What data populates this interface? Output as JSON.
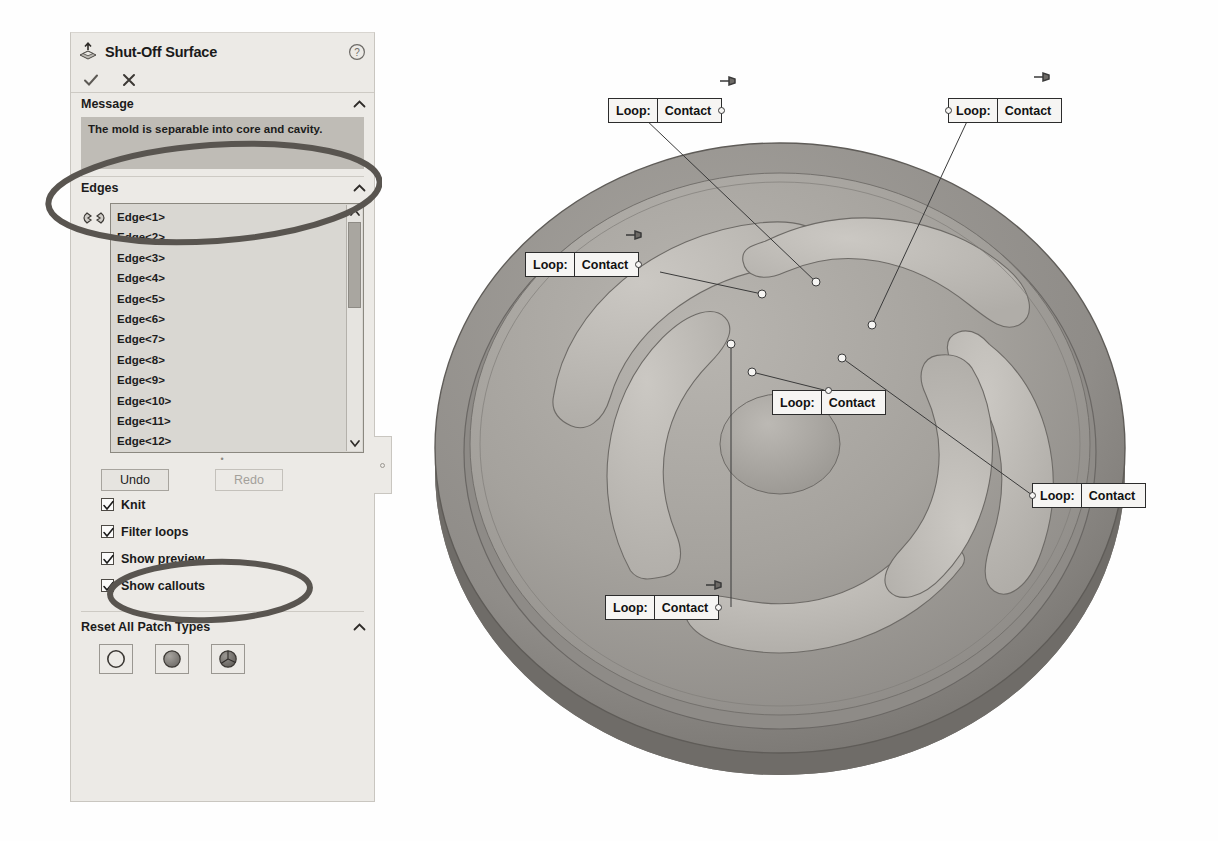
{
  "panel": {
    "title": "Shut-Off Surface",
    "title_icon": "shut-off-surface-icon",
    "help_icon": "help-icon",
    "ok_icon": "checkmark-icon",
    "cancel_icon": "x-icon",
    "sections": {
      "message": {
        "header": "Message",
        "collapse_icon": "chevron-up-icon",
        "text": "The mold is separable into core and cavity."
      },
      "edges": {
        "header": "Edges",
        "collapse_icon": "chevron-up-icon",
        "selection_icon": "edge-selection-icon",
        "items": [
          "Edge<1>",
          "Edge<2>",
          "Edge<3>",
          "Edge<4>",
          "Edge<5>",
          "Edge<6>",
          "Edge<7>",
          "Edge<8>",
          "Edge<9>",
          "Edge<10>",
          "Edge<11>",
          "Edge<12>"
        ],
        "scroll_up_icon": "chevron-up-icon",
        "scroll_down_icon": "chevron-down-icon"
      },
      "patch_types": {
        "header": "Reset All Patch Types",
        "collapse_icon": "chevron-up-icon",
        "buttons": [
          {
            "name": "no-fill-patch",
            "icon": "circle-outline-icon"
          },
          {
            "name": "contact-patch",
            "icon": "shaded-sphere-icon"
          },
          {
            "name": "tangent-patch",
            "icon": "sphere-with-seams-icon"
          }
        ]
      }
    },
    "buttons": {
      "undo": {
        "label": "Undo",
        "disabled": false
      },
      "redo": {
        "label": "Redo",
        "disabled": true
      }
    },
    "checkboxes": [
      {
        "label": "Knit",
        "checked": true
      },
      {
        "label": "Filter loops",
        "checked": true
      },
      {
        "label": "Show preview",
        "checked": true
      },
      {
        "label": "Show callouts",
        "checked": true
      }
    ]
  },
  "graphics": {
    "model_name": "impeller-shaded-model",
    "callouts": [
      {
        "key": "Loop:",
        "value": "Contact",
        "anchor": "right",
        "pin": true
      },
      {
        "key": "Loop:",
        "value": "Contact",
        "anchor": "left",
        "pin": true
      },
      {
        "key": "Loop:",
        "value": "Contact",
        "anchor": "right",
        "pin": true
      },
      {
        "key": "Loop:",
        "value": "Contact",
        "anchor": "topmid",
        "pin": false
      },
      {
        "key": "Loop:",
        "value": "Contact",
        "anchor": "left",
        "pin": false
      },
      {
        "key": "Loop:",
        "value": "Contact",
        "anchor": "right",
        "pin": true
      }
    ]
  },
  "annotations": {
    "message_ellipse": "hand-drawn-ellipse",
    "knit_ellipse": "hand-drawn-ellipse",
    "color": "#595550"
  }
}
